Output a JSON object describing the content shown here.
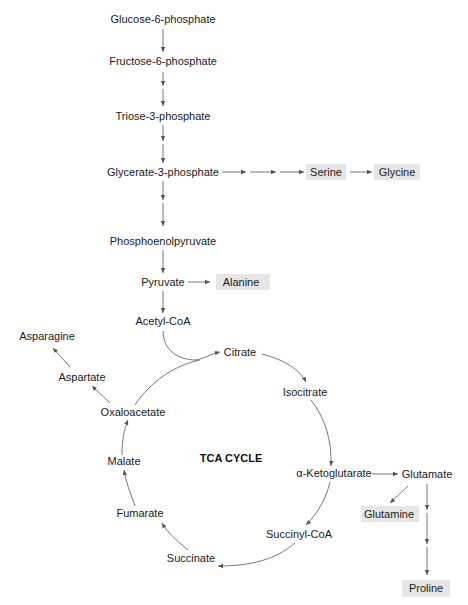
{
  "diagram": {
    "title": "TCA CYCLE",
    "glycolysis": [
      "Glucose-6-phosphate",
      "Fructose-6-phosphate",
      "Triose-3-phosphate",
      "Glycerate-3-phosphate",
      "Phosphoenolpyruvate",
      "Pyruvate",
      "Acetyl-CoA"
    ],
    "tca": [
      "Citrate",
      "Isocitrate",
      "α-Ketoglutarate",
      "Succinyl-CoA",
      "Succinate",
      "Fumarate",
      "Malate",
      "Oxaloacetate"
    ],
    "amino_acids": {
      "serine": "Serine",
      "glycine": "Glycine",
      "alanine": "Alanine",
      "aspartate": "Aspartate",
      "asparagine": "Asparagine",
      "glutamate": "Glutamate",
      "glutamine": "Glutamine",
      "proline": "Proline"
    },
    "highlight_color": "#e6e6e6",
    "line_color": "#555555"
  }
}
